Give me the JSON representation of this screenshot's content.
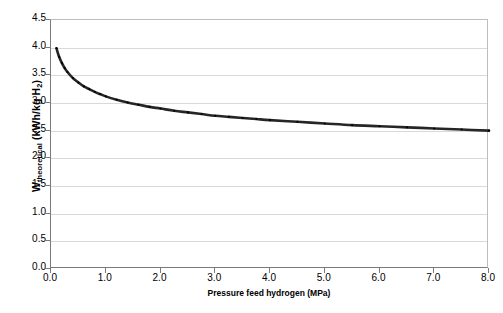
{
  "chart_data": {
    "type": "line",
    "title": "",
    "xlabel": "Pressure feed hydrogen (MPa)",
    "ylabel": "Wtheoretical (kWh/kg H2)",
    "ylabel_main": "W",
    "ylabel_sub": "theoretical",
    "ylabel_unit": " (kWh/kg H",
    "ylabel_unit_sub": "2",
    "ylabel_unit_end": ")",
    "xlim": [
      0.0,
      8.0
    ],
    "ylim": [
      0.0,
      4.5
    ],
    "xticks": [
      "0.0",
      "1.0",
      "2.0",
      "3.0",
      "4.0",
      "5.0",
      "6.0",
      "7.0",
      "8.0"
    ],
    "xtick_values": [
      0.0,
      1.0,
      2.0,
      3.0,
      4.0,
      5.0,
      6.0,
      7.0,
      8.0
    ],
    "yticks": [
      "0.0",
      "0.5",
      "1.0",
      "1.5",
      "2.0",
      "2.5",
      "3.0",
      "3.5",
      "4.0",
      "4.5"
    ],
    "ytick_values": [
      0.0,
      0.5,
      1.0,
      1.5,
      2.0,
      2.5,
      3.0,
      3.5,
      4.0,
      4.5
    ],
    "grid": true,
    "grid_axis": "y",
    "legend": false,
    "legend_position": "none",
    "series": [
      {
        "name": "Wtheoretical",
        "color": "#262626",
        "line_width": 2.6,
        "marker": "dot",
        "x": [
          0.1,
          0.15,
          0.2,
          0.25,
          0.3,
          0.4,
          0.5,
          0.6,
          0.7,
          0.8,
          0.9,
          1.0,
          1.2,
          1.4,
          1.6,
          1.8,
          2.0,
          2.25,
          2.5,
          2.75,
          3.0,
          3.25,
          3.5,
          3.75,
          4.0,
          4.5,
          5.0,
          5.5,
          6.0,
          6.5,
          7.0,
          7.5,
          8.0
        ],
        "y": [
          3.99,
          3.83,
          3.72,
          3.63,
          3.56,
          3.45,
          3.37,
          3.3,
          3.25,
          3.2,
          3.16,
          3.12,
          3.06,
          3.01,
          2.97,
          2.93,
          2.9,
          2.86,
          2.83,
          2.8,
          2.77,
          2.75,
          2.73,
          2.71,
          2.69,
          2.66,
          2.63,
          2.6,
          2.58,
          2.56,
          2.54,
          2.52,
          2.5
        ]
      }
    ]
  }
}
